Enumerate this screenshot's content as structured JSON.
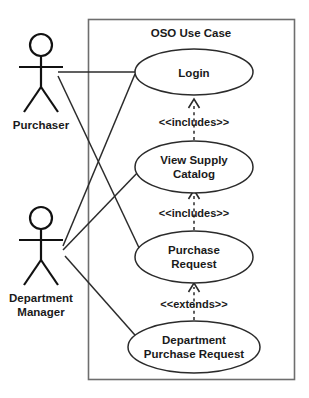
{
  "diagram": {
    "type": "uml-use-case-diagram",
    "boundary": {
      "title": "OSO Use Case"
    },
    "actors": [
      {
        "id": "purchaser",
        "label": "Purchaser",
        "label_lines": [
          "Purchaser"
        ]
      },
      {
        "id": "department-manager",
        "label": "Department Manager",
        "label_lines": [
          "Department",
          "Manager"
        ]
      }
    ],
    "use_cases": [
      {
        "id": "login",
        "label": "Login",
        "label_lines": [
          "Login"
        ]
      },
      {
        "id": "view-supply-catalog",
        "label": "View Supply Catalog",
        "label_lines": [
          "View Supply",
          "Catalog"
        ]
      },
      {
        "id": "purchase-request",
        "label": "Purchase Request",
        "label_lines": [
          "Purchase",
          "Request"
        ]
      },
      {
        "id": "department-purchase-request",
        "label": "Department Purchase Request",
        "label_lines": [
          "Department",
          "Purchase Request"
        ]
      }
    ],
    "relationships": [
      {
        "id": "rel-includes-1",
        "stereotype": "<<includes>>",
        "from": "view-supply-catalog",
        "to": "login",
        "style": "dashed-open-arrow"
      },
      {
        "id": "rel-includes-2",
        "stereotype": "<<includes>>",
        "from": "purchase-request",
        "to": "view-supply-catalog",
        "style": "dashed-open-arrow"
      },
      {
        "id": "rel-extends-1",
        "stereotype": "<<extends>>",
        "from": "department-purchase-request",
        "to": "purchase-request",
        "style": "dashed-open-arrow"
      }
    ],
    "associations": [
      {
        "id": "assoc-purchaser-login",
        "actor": "purchaser",
        "use_case": "login"
      },
      {
        "id": "assoc-purchaser-purchase-request",
        "actor": "purchaser",
        "use_case": "purchase-request"
      },
      {
        "id": "assoc-manager-login",
        "actor": "department-manager",
        "use_case": "login"
      },
      {
        "id": "assoc-manager-view-supply-catalog",
        "actor": "department-manager",
        "use_case": "view-supply-catalog"
      },
      {
        "id": "assoc-manager-department-purchase-request",
        "actor": "department-manager",
        "use_case": "department-purchase-request"
      }
    ],
    "colors": {
      "background": "#ffffff",
      "stroke": "#2b2b2b",
      "actor_stroke": "#111111",
      "boundary_stroke": "#6e6e6e",
      "text": "#1a1a1a"
    }
  }
}
